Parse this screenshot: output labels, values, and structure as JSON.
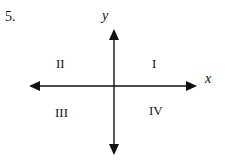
{
  "problem": {
    "number": "5."
  },
  "axes": {
    "x_label": "x",
    "y_label": "y"
  },
  "quadrants": [
    {
      "id": "I",
      "label": "I"
    },
    {
      "id": "II",
      "label": "II"
    },
    {
      "id": "III",
      "label": "III"
    },
    {
      "id": "IV",
      "label": "IV"
    }
  ],
  "colors": {
    "ink": "#111111",
    "background": "#ffffff"
  }
}
